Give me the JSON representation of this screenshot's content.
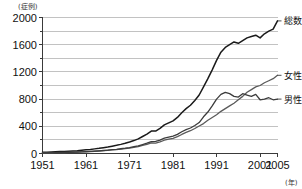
{
  "chart_data": {
    "type": "line",
    "title": "",
    "xlabel": "年",
    "ylabel": "症例",
    "y_unit_label": "(症例)",
    "x_unit_label": "(年)",
    "xlim": [
      1951,
      2005
    ],
    "ylim": [
      0,
      2000
    ],
    "grid": true,
    "grid_interval": 200,
    "legend_position": "right-inline",
    "y_ticks": [
      0,
      400,
      800,
      1200,
      1600,
      2000
    ],
    "y_tick_labels": [
      "0",
      "400",
      "800",
      "1200",
      "1600",
      "2000"
    ],
    "y_minor_ticks": [
      200,
      600,
      1000,
      1400,
      1800
    ],
    "x_ticks": [
      1951,
      1961,
      1971,
      1981,
      1991,
      2001,
      2005
    ],
    "x_tick_labels": [
      "1951",
      "1961",
      "1971",
      "1981",
      "1991",
      "2001",
      "2005"
    ],
    "series": [
      {
        "name": "総数",
        "legend_label": "総数",
        "color": "#1a1a1a",
        "width": 1.5,
        "x": [
          1951,
          1952,
          1953,
          1954,
          1955,
          1956,
          1957,
          1958,
          1959,
          1960,
          1961,
          1962,
          1963,
          1964,
          1965,
          1966,
          1967,
          1968,
          1969,
          1970,
          1971,
          1972,
          1973,
          1974,
          1975,
          1976,
          1977,
          1978,
          1979,
          1980,
          1981,
          1982,
          1983,
          1984,
          1985,
          1986,
          1987,
          1988,
          1989,
          1990,
          1991,
          1992,
          1993,
          1994,
          1995,
          1996,
          1997,
          1998,
          1999,
          2000,
          2001,
          2002,
          2003,
          2004,
          2005
        ],
        "y": [
          18,
          20,
          22,
          25,
          28,
          30,
          34,
          38,
          42,
          48,
          54,
          60,
          68,
          76,
          86,
          96,
          108,
          120,
          134,
          150,
          168,
          190,
          215,
          250,
          285,
          330,
          330,
          370,
          420,
          450,
          480,
          530,
          600,
          660,
          710,
          780,
          860,
          980,
          1100,
          1230,
          1370,
          1490,
          1560,
          1600,
          1640,
          1620,
          1660,
          1700,
          1720,
          1740,
          1700,
          1760,
          1800,
          1830,
          1950
        ]
      },
      {
        "name": "女性",
        "legend_label": "女性",
        "color": "#5a5a5a",
        "width": 1.3,
        "x": [
          1951,
          1952,
          1953,
          1954,
          1955,
          1956,
          1957,
          1958,
          1959,
          1960,
          1961,
          1962,
          1963,
          1964,
          1965,
          1966,
          1967,
          1968,
          1969,
          1970,
          1971,
          1972,
          1973,
          1974,
          1975,
          1976,
          1977,
          1978,
          1979,
          1980,
          1981,
          1982,
          1983,
          1984,
          1985,
          1986,
          1987,
          1988,
          1989,
          1990,
          1991,
          1992,
          1993,
          1994,
          1995,
          1996,
          1997,
          1998,
          1999,
          2000,
          2001,
          2002,
          2003,
          2004,
          2005
        ],
        "y": [
          8,
          9,
          10,
          12,
          13,
          14,
          16,
          18,
          20,
          23,
          26,
          29,
          33,
          37,
          42,
          46,
          52,
          58,
          64,
          72,
          80,
          90,
          102,
          118,
          134,
          155,
          152,
          172,
          195,
          210,
          224,
          248,
          280,
          310,
          335,
          368,
          405,
          440,
          490,
          530,
          570,
          620,
          660,
          700,
          740,
          790,
          840,
          900,
          940,
          980,
          1000,
          1040,
          1070,
          1100,
          1150
        ]
      },
      {
        "name": "男性",
        "legend_label": "男性",
        "color": "#3c3c3c",
        "width": 1.3,
        "x": [
          1951,
          1952,
          1953,
          1954,
          1955,
          1956,
          1957,
          1958,
          1959,
          1960,
          1961,
          1962,
          1963,
          1964,
          1965,
          1966,
          1967,
          1968,
          1969,
          1970,
          1971,
          1972,
          1973,
          1974,
          1975,
          1976,
          1977,
          1978,
          1979,
          1980,
          1981,
          1982,
          1983,
          1984,
          1985,
          1986,
          1987,
          1988,
          1989,
          1990,
          1991,
          1992,
          1993,
          1994,
          1995,
          1996,
          1997,
          1998,
          1999,
          2000,
          2001,
          2002,
          2003,
          2004,
          2005
        ],
        "y": [
          10,
          11,
          12,
          13,
          15,
          16,
          18,
          20,
          22,
          25,
          28,
          31,
          35,
          39,
          44,
          50,
          56,
          62,
          70,
          78,
          88,
          100,
          113,
          132,
          151,
          175,
          178,
          198,
          225,
          240,
          256,
          282,
          320,
          350,
          375,
          412,
          455,
          540,
          610,
          700,
          800,
          870,
          900,
          880,
          840,
          830,
          880,
          860,
          840,
          870,
          790,
          800,
          820,
          790,
          800
        ]
      }
    ]
  }
}
